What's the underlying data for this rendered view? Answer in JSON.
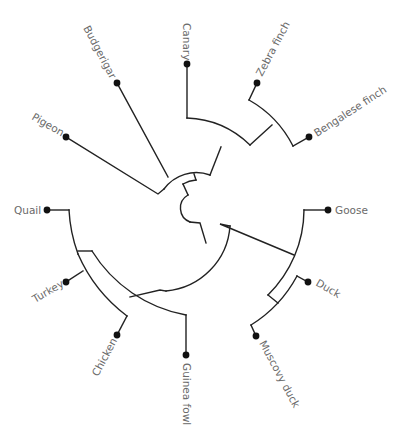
{
  "diagram": {
    "type": "circular phylogenetic tree (cladogram)",
    "colors": {
      "branch": "#222222",
      "tip": "#111111",
      "label": "#6a6a6a",
      "background": "#ffffff"
    },
    "taxa": [
      {
        "id": "canary",
        "label": "Canary"
      },
      {
        "id": "zebra_finch",
        "label": "Zebra finch"
      },
      {
        "id": "bengalese_finch",
        "label": "Bengalese finch"
      },
      {
        "id": "goose",
        "label": "Goose"
      },
      {
        "id": "duck",
        "label": "Duck"
      },
      {
        "id": "muscovy_duck",
        "label": "Muscovy duck"
      },
      {
        "id": "guinea_fowl",
        "label": "Guinea fowl"
      },
      {
        "id": "chicken",
        "label": "Chicken"
      },
      {
        "id": "turkey",
        "label": "Turkey"
      },
      {
        "id": "quail",
        "label": "Quail"
      },
      {
        "id": "pigeon",
        "label": "Pigeon"
      },
      {
        "id": "budgerigar",
        "label": "Budgerigar"
      }
    ],
    "clades": [
      {
        "name": "songbirds",
        "members": [
          "Canary",
          "Zebra finch",
          "Bengalese finch"
        ]
      },
      {
        "name": "finches",
        "members": [
          "Zebra finch",
          "Bengalese finch"
        ]
      },
      {
        "name": "waterfowl",
        "members": [
          "Goose",
          "Duck",
          "Muscovy duck"
        ]
      },
      {
        "name": "ducks",
        "members": [
          "Duck",
          "Muscovy duck"
        ]
      },
      {
        "name": "landfowl",
        "members": [
          "Quail",
          "Turkey",
          "Chicken",
          "Guinea fowl"
        ]
      },
      {
        "name": "quail_turkey_chicken",
        "members": [
          "Quail",
          "Turkey",
          "Chicken"
        ]
      },
      {
        "name": "turkey_chicken",
        "members": [
          "Turkey",
          "Chicken"
        ]
      }
    ]
  }
}
